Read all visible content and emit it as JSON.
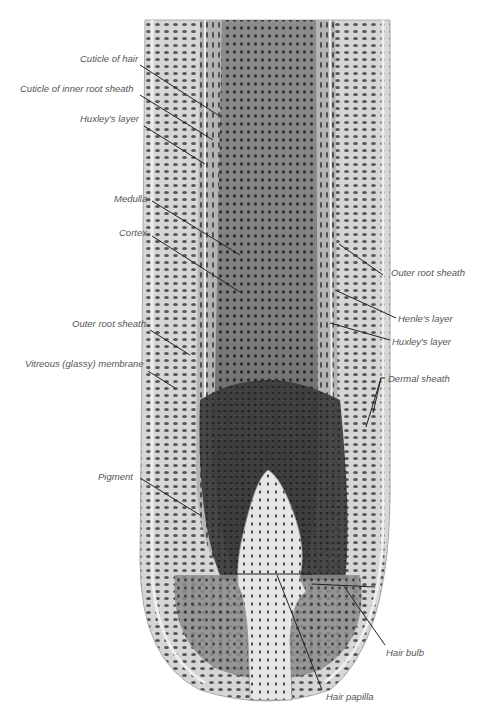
{
  "diagram": {
    "colors": {
      "background": "#ffffff",
      "outer_layers": "#d8d8d8",
      "sheath_light": "#c9c9c9",
      "cortex": "#8a8a8a",
      "bulb_dark": "#3a3a3a",
      "papilla": "#e4e4e4",
      "nuclei": "#4a4a4a",
      "leader_line": "#222222",
      "label_text": "#555555"
    },
    "labels_left": [
      {
        "id": "cuticle-of-hair",
        "text": "Cuticle of hair"
      },
      {
        "id": "cuticle-of-inner-root-sheath",
        "text": "Cuticle of inner root sheath"
      },
      {
        "id": "huxleys-layer-left",
        "text": "Huxley's layer"
      },
      {
        "id": "medulla",
        "text": "Medulla"
      },
      {
        "id": "cortex",
        "text": "Cortex"
      },
      {
        "id": "outer-root-sheath-left",
        "text": "Outer root sheath"
      },
      {
        "id": "vitreous-membrane",
        "text": "Vitreous (glassy) membrane"
      },
      {
        "id": "pigment",
        "text": "Pigment"
      }
    ],
    "labels_right": [
      {
        "id": "outer-root-sheath-right",
        "text": "Outer root sheath"
      },
      {
        "id": "henles-layer",
        "text": "Henle's layer"
      },
      {
        "id": "huxleys-layer-right",
        "text": "Huxley's layer"
      },
      {
        "id": "dermal-sheath",
        "text": "Dermal sheath"
      },
      {
        "id": "hair-bulb",
        "text": "Hair bulb"
      },
      {
        "id": "hair-papilla",
        "text": "Hair papilla"
      }
    ]
  }
}
